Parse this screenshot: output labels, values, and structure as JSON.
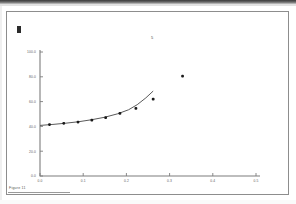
{
  "document": {
    "caption": "Figure 11",
    "corner_mark": "registration-mark"
  },
  "chart_data": {
    "type": "scatter",
    "title": "",
    "subtitle": "",
    "xlabel": "",
    "ylabel": "",
    "annotation": "5",
    "grid": false,
    "legend": null,
    "xlim": [
      0.0,
      0.5
    ],
    "ylim": [
      0.0,
      100.0
    ],
    "xticks": [
      0.0,
      0.1,
      0.2,
      0.3,
      0.4,
      0.5
    ],
    "yticks": [
      0.0,
      20.0,
      40.0,
      60.0,
      80.0,
      100.0
    ],
    "xtick_labels": [
      "0.0",
      "0.1",
      "0.2",
      "0.3",
      "0.4",
      "0.5"
    ],
    "ytick_labels": [
      "0.0",
      "20.0",
      "40.0",
      "60.0",
      "80.0",
      "100.0"
    ],
    "points": [
      {
        "x": 0.022,
        "y": 41.5
      },
      {
        "x": 0.055,
        "y": 42.5
      },
      {
        "x": 0.088,
        "y": 43.5
      },
      {
        "x": 0.12,
        "y": 45.0
      },
      {
        "x": 0.152,
        "y": 47.0
      },
      {
        "x": 0.185,
        "y": 50.5
      },
      {
        "x": 0.222,
        "y": 54.5
      },
      {
        "x": 0.262,
        "y": 62.0
      },
      {
        "x": 0.33,
        "y": 80.5
      }
    ],
    "series": [
      {
        "name": "observed",
        "values": [
          41.5,
          42.5,
          43.5,
          45.0,
          47.0,
          50.5,
          54.5,
          62.0,
          80.5
        ]
      },
      {
        "name": "fitted-curve",
        "x": [
          0.0,
          0.03,
          0.06,
          0.09,
          0.12,
          0.15,
          0.18,
          0.205,
          0.225,
          0.245,
          0.262
        ],
        "values": [
          40.8,
          41.6,
          42.6,
          43.8,
          45.4,
          47.4,
          50.2,
          53.4,
          57.5,
          63.0,
          68.5
        ]
      }
    ]
  },
  "colors": {
    "point": "#1a1a1a",
    "curve": "#5a5a5a",
    "axis": "#7d7d7d",
    "tick_text": "#5e5e5e",
    "page_border": "#8d8d8d",
    "scan_band": "#3a3a3a"
  }
}
